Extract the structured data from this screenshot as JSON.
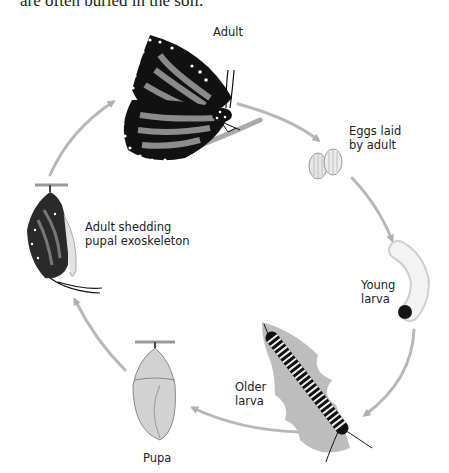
{
  "caption_fragment": "are often buried in the soil.",
  "diagram": {
    "stages": [
      {
        "id": "adult",
        "label": "Adult"
      },
      {
        "id": "eggs",
        "label_line1": "Eggs laid",
        "label_line2": "by adult"
      },
      {
        "id": "young_larva",
        "label_line1": "Young",
        "label_line2": "larva"
      },
      {
        "id": "older_larva",
        "label_line1": "Older",
        "label_line2": "larva"
      },
      {
        "id": "pupa",
        "label": "Pupa"
      },
      {
        "id": "emerging",
        "label_line1": "Adult shedding",
        "label_line2": "pupal exoskeleton"
      }
    ],
    "arrow_color": "#b5b5b5"
  }
}
